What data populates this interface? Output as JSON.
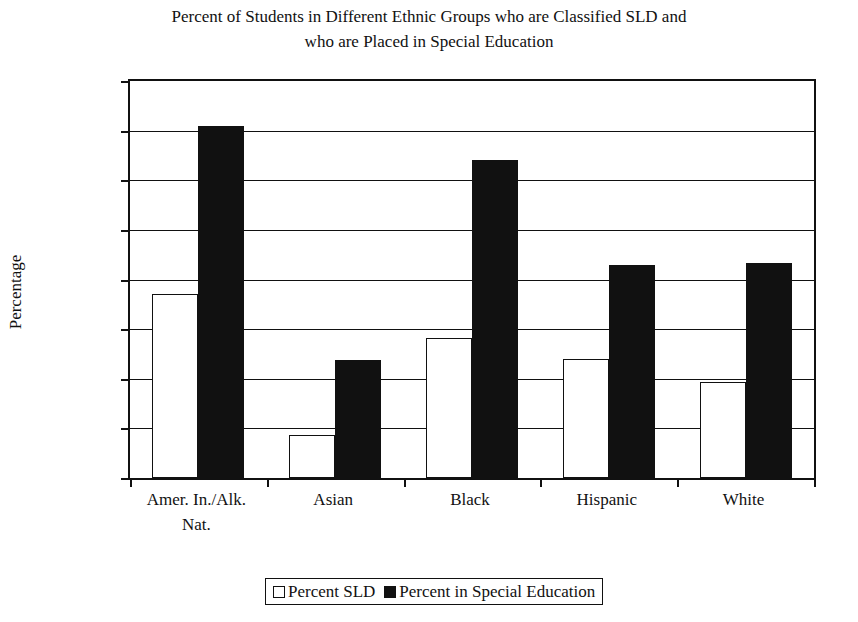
{
  "chart_data": {
    "type": "bar",
    "title": "Percent of Students in Different Ethnic Groups who are Classified SLD and who are Placed in Special Education",
    "title_lines": [
      "Percent of Students in Different Ethnic Groups who are Classified SLD and",
      "who are Placed in Special Education"
    ],
    "xlabel": "",
    "ylabel": "Percentage",
    "ylim": [
      0,
      16
    ],
    "ytick_values": [
      0,
      2,
      4,
      6,
      8,
      10,
      12,
      14,
      16
    ],
    "ytick_labels": [
      "0%",
      "2%",
      "4%",
      "6%",
      "8%",
      "10%",
      "12%",
      "14%",
      "16%"
    ],
    "grid": true,
    "legend_position": "bottom",
    "categories": [
      "Amer. In./Alk. Nat.",
      "Asian",
      "Black",
      "Hispanic",
      "White"
    ],
    "category_label_lines": [
      [
        "Amer. In./Alk.",
        "Nat."
      ],
      [
        "Asian"
      ],
      [
        "Black"
      ],
      [
        "Hispanic"
      ],
      [
        "White"
      ]
    ],
    "series": [
      {
        "name": "Percent SLD",
        "color": "#ffffff",
        "edge_color": "#111111",
        "values": [
          7.4,
          1.75,
          5.65,
          4.8,
          3.85
        ]
      },
      {
        "name": "Percent in Special Education",
        "color": "#111111",
        "edge_color": "#111111",
        "values": [
          14.2,
          4.75,
          12.8,
          8.6,
          8.65
        ]
      }
    ]
  },
  "legend": {
    "entries": [
      {
        "label": "Percent SLD",
        "swatch": "open-square"
      },
      {
        "label": "Percent in Special Education",
        "swatch": "filled-square"
      }
    ]
  }
}
